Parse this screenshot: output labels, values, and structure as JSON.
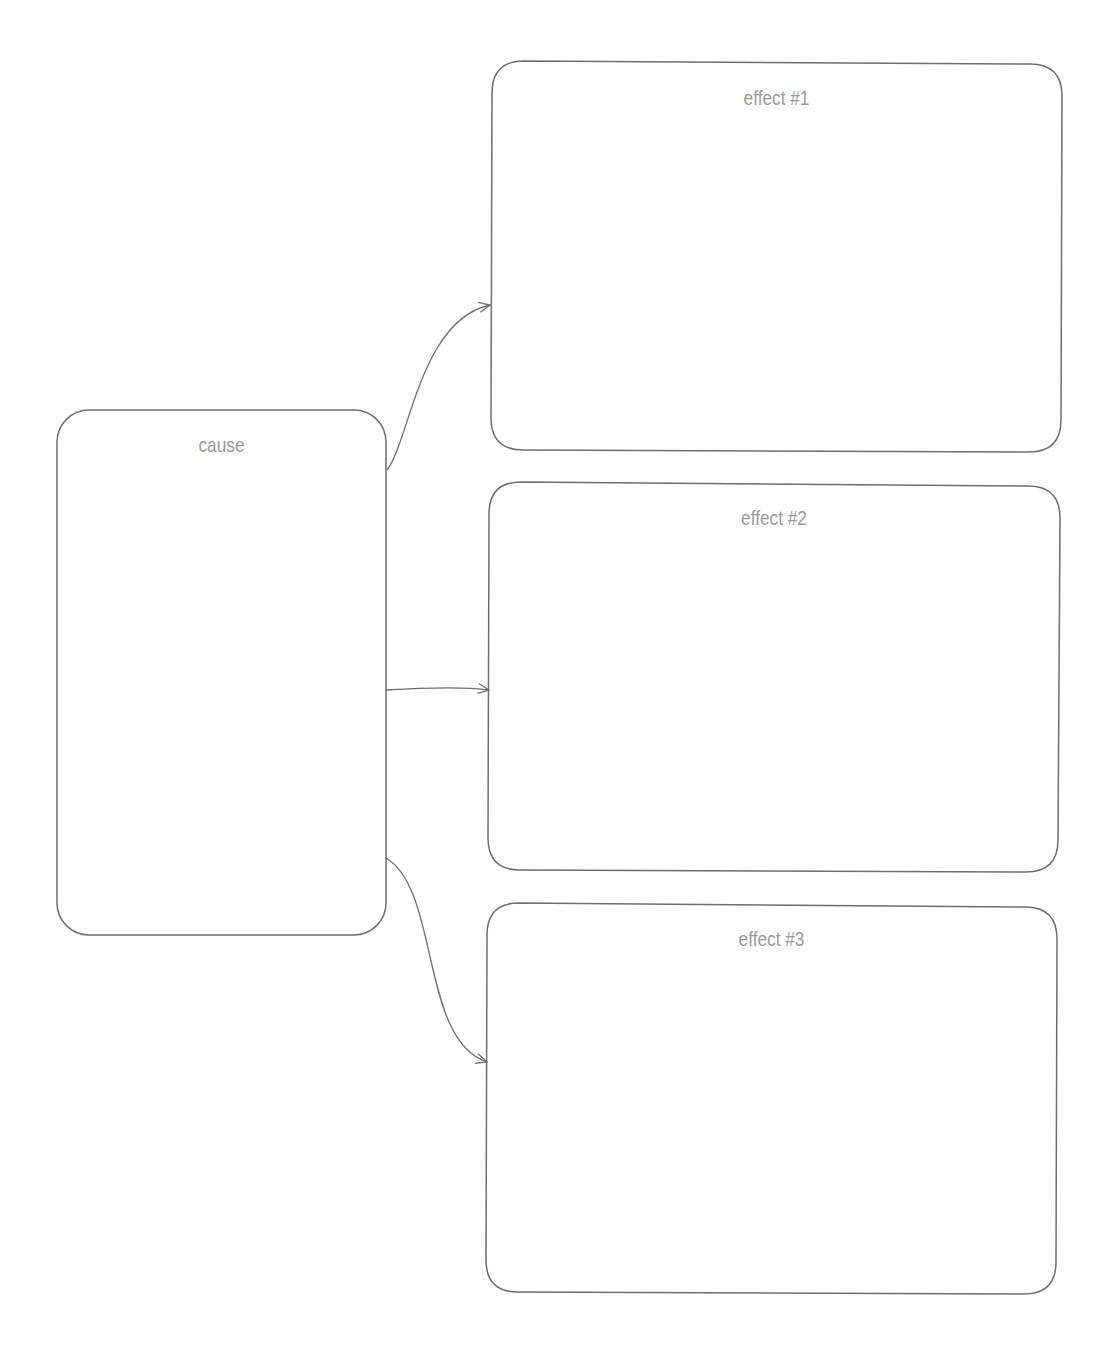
{
  "diagram": {
    "type": "cause-effect-organizer",
    "top_fragment_text": "",
    "colors": {
      "stroke": "#6e6e6e",
      "label": "#9a9a9a",
      "background": "#ffffff"
    },
    "cause": {
      "label": "cause"
    },
    "effects": [
      {
        "label": "effect #1"
      },
      {
        "label": "effect #2"
      },
      {
        "label": "effect #3"
      }
    ],
    "connectors": [
      {
        "from": "cause",
        "to": "effect #1"
      },
      {
        "from": "cause",
        "to": "effect #2"
      },
      {
        "from": "cause",
        "to": "effect #3"
      }
    ]
  }
}
